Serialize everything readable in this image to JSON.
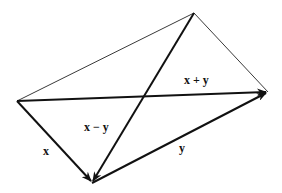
{
  "diagram": {
    "type": "parallelogram-vector-diagram",
    "vertices": {
      "left": [
        17,
        101
      ],
      "top": [
        194,
        13
      ],
      "right": [
        268,
        92
      ],
      "bottom": [
        92,
        183
      ]
    },
    "labels": {
      "x": "x",
      "y": "y",
      "sum": "x + y",
      "diff": "x − y"
    },
    "colors": {
      "line_thin": "#3a3a3a",
      "line_thick": "#111111",
      "background": "#ffffff"
    }
  }
}
